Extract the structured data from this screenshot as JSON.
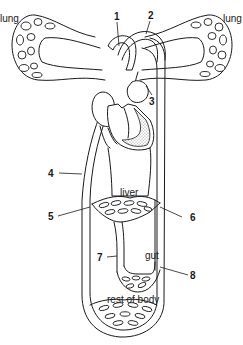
{
  "diagram": {
    "organs": {
      "lung_left": "lung",
      "lung_right": "lung",
      "liver": "liver",
      "gut": "gut",
      "body": "rest of body"
    },
    "numbered_labels": [
      "1",
      "2",
      "3",
      "4",
      "5",
      "6",
      "7",
      "8"
    ],
    "colors": {
      "line": "#1a1a1a",
      "background": "#ffffff",
      "stipple": "#b5b5b5"
    }
  }
}
